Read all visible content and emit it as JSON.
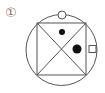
{
  "diagram": {
    "label": "①",
    "circle": {
      "cx": 61.5,
      "cy": 50,
      "r": 35.5
    },
    "square": {
      "x1": 37,
      "y1": 23,
      "x2": 86,
      "y2": 75
    },
    "markers": [
      {
        "type": "open-circle",
        "cx": 62,
        "cy": 15,
        "r": 4
      },
      {
        "type": "small-dot",
        "cx": 62,
        "cy": 32,
        "r": 3
      },
      {
        "type": "large-dot",
        "cx": 77,
        "cy": 49,
        "r": 4.5
      },
      {
        "type": "open-square",
        "x": 89,
        "y": 45,
        "size": 7
      }
    ],
    "colors": {
      "stroke": "#555555",
      "fill": "#111111",
      "label": "#777777"
    }
  }
}
